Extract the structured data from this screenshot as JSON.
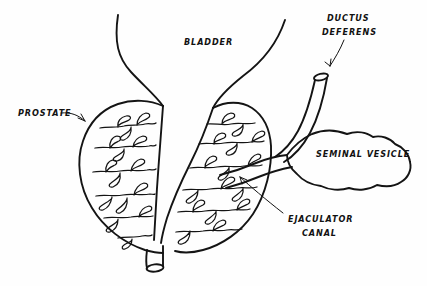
{
  "figure": {
    "style": "black ink line drawing on white background",
    "width": 427,
    "height": 286,
    "ink_color": "#141414",
    "background_color": "#fefefe"
  },
  "labels": {
    "prostate": {
      "text": "PROSTATE",
      "x": 18,
      "y": 116
    },
    "bladder": {
      "text": "BLADDER",
      "x": 184,
      "y": 45
    },
    "ductus_deferens_line1": {
      "text": "DUCTUS",
      "x": 327,
      "y": 21
    },
    "ductus_deferens_line2": {
      "text": "DEFERENS",
      "x": 322,
      "y": 35
    },
    "seminal_vesicle": {
      "text": "SEMINAL VESICLE",
      "x": 316,
      "y": 157
    },
    "ejaculator_canal_line1": {
      "text": "EJACULATOR",
      "x": 288,
      "y": 222
    },
    "ejaculator_canal_line2": {
      "text": "CANAL",
      "x": 302,
      "y": 236
    }
  },
  "structures": [
    {
      "name": "bladder-neck",
      "description": "funnel shaped bladder outlet narrowing downward between the prostate lobes"
    },
    {
      "name": "prostate-left-lobe",
      "description": "rounded left lobe containing branching tubuloalveolar glands"
    },
    {
      "name": "prostate-right-lobe",
      "description": "rounded right lobe containing branching tubuloalveolar glands"
    },
    {
      "name": "urethra",
      "description": "central channel running vertically through the prostate and exiting below as a cut tube"
    },
    {
      "name": "ductus-deferens",
      "description": "cut tube descending from upper right toward the prostate base"
    },
    {
      "name": "seminal-vesicle",
      "description": "lobulated sac to the right of the prostate"
    },
    {
      "name": "ejaculator-canal",
      "description": "duct joining the seminal vesicle and ductus deferens into the prostate"
    }
  ]
}
